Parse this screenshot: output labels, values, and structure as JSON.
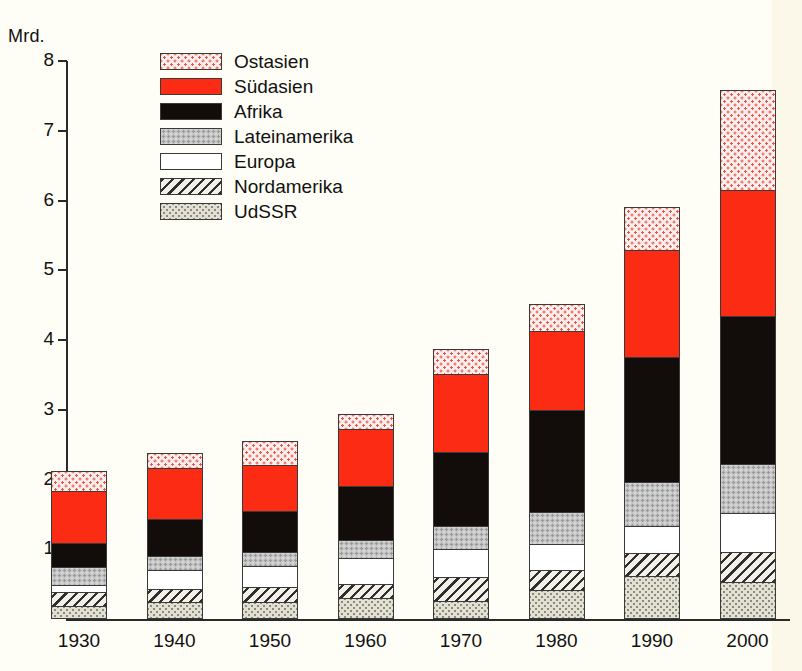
{
  "axis": {
    "unit_label": "Mrd.",
    "y_ticks": [
      8,
      7,
      6,
      5,
      4,
      3,
      2,
      1
    ],
    "y_min": 0,
    "y_max": 8
  },
  "legend": {
    "items": [
      {
        "label": "Ostasien",
        "key": "ostasien",
        "fill": "#fbeeec",
        "pattern": "red-dots"
      },
      {
        "label": "Südasien",
        "key": "suedasien",
        "fill": "#fb2b14",
        "pattern": "solid"
      },
      {
        "label": "Afrika",
        "key": "afrika",
        "fill": "#120d0a",
        "pattern": "solid"
      },
      {
        "label": "Lateinamerika",
        "key": "lateinamerika",
        "fill": "#c3c3c3",
        "pattern": "gray-dots"
      },
      {
        "label": "Europa",
        "key": "europa",
        "fill": "#ffffff",
        "pattern": "empty"
      },
      {
        "label": "Nordamerika",
        "key": "nordamerika",
        "fill": "#f3f1e7",
        "pattern": "diagonal-hatch"
      },
      {
        "label": "UdSSR",
        "key": "udssr",
        "fill": "#e2e0d3",
        "pattern": "fine-dots"
      }
    ]
  },
  "chart_data": {
    "type": "bar",
    "stacked": true,
    "title": "",
    "subtitle": "",
    "xlabel": "",
    "ylabel": "Mrd.",
    "ylim": [
      0,
      8
    ],
    "grid": false,
    "legend_position": "top-left-inside",
    "categories": [
      "1930",
      "1940",
      "1950",
      "1960",
      "1970",
      "1980",
      "1990",
      "2000"
    ],
    "series": [
      {
        "name": "UdSSR",
        "values": [
          0.19,
          0.24,
          0.24,
          0.3,
          0.26,
          0.41,
          0.6,
          0.53
        ]
      },
      {
        "name": "Nordamerika",
        "values": [
          0.2,
          0.19,
          0.22,
          0.2,
          0.34,
          0.29,
          0.34,
          0.43
        ]
      },
      {
        "name": "Europa",
        "values": [
          0.1,
          0.27,
          0.3,
          0.37,
          0.41,
          0.38,
          0.38,
          0.56
        ]
      },
      {
        "name": "Lateinamerika",
        "values": [
          0.26,
          0.21,
          0.2,
          0.26,
          0.32,
          0.46,
          0.64,
          0.7
        ]
      },
      {
        "name": "Afrika",
        "values": [
          0.34,
          0.52,
          0.59,
          0.78,
          1.07,
          1.46,
          1.79,
          2.12
        ]
      },
      {
        "name": "Südasien",
        "values": [
          0.74,
          0.73,
          0.66,
          0.82,
          1.11,
          1.13,
          1.53,
          1.81
        ]
      },
      {
        "name": "Ostasien",
        "values": [
          0.29,
          0.22,
          0.34,
          0.21,
          0.36,
          0.38,
          0.62,
          1.43
        ]
      }
    ],
    "totals": [
      2.12,
      2.38,
      2.55,
      2.94,
      3.87,
      4.51,
      5.91,
      7.58
    ],
    "cumulative_tops": {
      "1930": {
        "UdSSR": 0.19,
        "Nordamerika": 0.39,
        "Europa": 0.49,
        "Lateinamerika": 0.75,
        "Afrika": 1.09,
        "Südasien": 1.83,
        "Ostasien": 2.12
      },
      "1940": {
        "UdSSR": 0.24,
        "Nordamerika": 0.43,
        "Europa": 0.7,
        "Lateinamerika": 0.91,
        "Afrika": 1.43,
        "Südasien": 2.16,
        "Ostasien": 2.38
      },
      "1950": {
        "UdSSR": 0.24,
        "Nordamerika": 0.46,
        "Europa": 0.76,
        "Lateinamerika": 0.96,
        "Afrika": 1.55,
        "Südasien": 2.21,
        "Ostasien": 2.55
      },
      "1960": {
        "UdSSR": 0.3,
        "Nordamerika": 0.5,
        "Europa": 0.87,
        "Lateinamerika": 1.13,
        "Afrika": 1.91,
        "Südasien": 2.73,
        "Ostasien": 2.94
      },
      "1970": {
        "UdSSR": 0.26,
        "Nordamerika": 0.6,
        "Europa": 1.01,
        "Lateinamerika": 1.33,
        "Afrika": 2.4,
        "Südasien": 3.51,
        "Ostasien": 3.87
      },
      "1980": {
        "UdSSR": 0.41,
        "Nordamerika": 0.7,
        "Europa": 1.08,
        "Lateinamerika": 1.54,
        "Afrika": 3.0,
        "Südasien": 4.13,
        "Ostasien": 4.51
      },
      "1990": {
        "UdSSR": 0.6,
        "Nordamerika": 0.94,
        "Europa": 1.32,
        "Lateinamerika": 1.96,
        "Afrika": 3.75,
        "Südasien": 5.28,
        "Ostasien": 5.91
      },
      "2000": {
        "UdSSR": 0.53,
        "Nordamerika": 0.96,
        "Europa": 1.52,
        "Lateinamerika": 2.22,
        "Afrika": 4.34,
        "Südasien": 6.15,
        "Ostasien": 7.58
      }
    }
  }
}
